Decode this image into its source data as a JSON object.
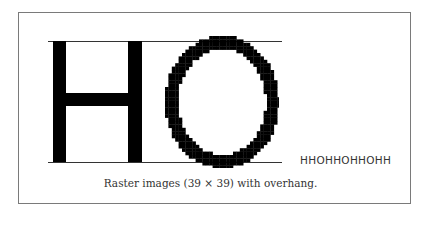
{
  "figure": {
    "caption": "Raster images (39 × 39) with overhang.",
    "sample_text": "HHOHHOHHOHH",
    "glyphs": [
      {
        "char": "H",
        "grid": "39x39"
      },
      {
        "char": "O",
        "grid": "39x39",
        "overhang": true
      }
    ],
    "colors": {
      "ink": "#000000",
      "guide": "#333333",
      "frame": "#7a7a7a",
      "text": "#333333"
    }
  }
}
